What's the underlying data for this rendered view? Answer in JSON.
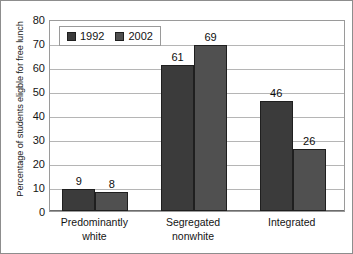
{
  "chart_data": {
    "type": "bar",
    "title": "",
    "subtitle": "",
    "xlabel": "",
    "ylabel": "Percentage of students eligble for free lunch",
    "ylim": [
      0,
      80
    ],
    "yticks": [
      0,
      10,
      20,
      30,
      40,
      50,
      60,
      70,
      80
    ],
    "ytick_labels": [
      "0",
      "10",
      "20",
      "30",
      "40",
      "50",
      "60",
      "70",
      "80"
    ],
    "grid": "horizontal",
    "legend_position": "top-left-inside",
    "categories": [
      "Predominantly white",
      "Segregated nonwhite",
      "Integrated"
    ],
    "category_lines": [
      [
        "Predominantly",
        "white"
      ],
      [
        "Segregated",
        "nonwhite"
      ],
      [
        "Integrated",
        ""
      ]
    ],
    "series": [
      {
        "name": "1992",
        "color": "#3b3b3b",
        "values": [
          9,
          61,
          46
        ],
        "value_labels": [
          "9",
          "61",
          "46"
        ]
      },
      {
        "name": "2002",
        "color": "#505050",
        "values": [
          8,
          69,
          26
        ],
        "value_labels": [
          "8",
          "69",
          "26"
        ]
      }
    ],
    "annotations": []
  },
  "legend": {
    "entries": [
      {
        "label": "1992",
        "swatch": "legend-swatch-1992"
      },
      {
        "label": "2002",
        "swatch": "legend-swatch-2002"
      }
    ]
  },
  "colors": {
    "series_1992": "#3b3b3b",
    "series_2002": "#505050",
    "gridline": "#b5b5b5",
    "frame": "#9a9a9a",
    "text": "#141414",
    "background": "#ffffff"
  }
}
